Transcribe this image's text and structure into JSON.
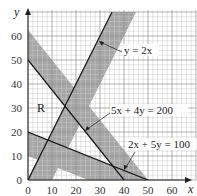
{
  "chart_data": {
    "type": "line",
    "title": "",
    "xlabel": "x",
    "ylabel": "y",
    "xlim": [
      0,
      70
    ],
    "ylim": [
      0,
      70
    ],
    "grid": true,
    "x_ticks": [
      "0",
      "10",
      "20",
      "30",
      "40",
      "50",
      "60"
    ],
    "y_ticks": [
      "0",
      "10",
      "20",
      "30",
      "40",
      "50",
      "60"
    ],
    "series": [
      {
        "name": "y = 2x",
        "points": [
          [
            0,
            0
          ],
          [
            35,
            70
          ]
        ]
      },
      {
        "name": "5x + 4y = 200",
        "points": [
          [
            0,
            50
          ],
          [
            40,
            0
          ]
        ]
      },
      {
        "name": "2x + 5y = 100",
        "points": [
          [
            0,
            20
          ],
          [
            50,
            0
          ]
        ]
      }
    ],
    "shaded_bands": [
      {
        "line": "y = 2x",
        "side": "below/right",
        "polygon": [
          [
            0,
            0
          ],
          [
            10,
            0
          ],
          [
            45,
            70
          ],
          [
            35,
            70
          ]
        ]
      },
      {
        "line": "5x + 4y = 200",
        "side": "above",
        "polygon": [
          [
            0,
            50
          ],
          [
            40,
            0
          ],
          [
            50,
            0
          ],
          [
            0,
            62.5
          ]
        ]
      },
      {
        "line": "2x + 5y = 100",
        "side": "below",
        "polygon": [
          [
            0,
            20
          ],
          [
            50,
            0
          ],
          [
            25,
            0
          ],
          [
            0,
            10
          ]
        ]
      }
    ],
    "annotations": [
      {
        "text": "R",
        "x": 6,
        "y": 30
      },
      {
        "text": "y = 2x",
        "x": 38,
        "y": 52
      },
      {
        "text": "5x + 4y = 200",
        "x": 34,
        "y": 27
      },
      {
        "text": "2x + 5y = 100",
        "x": 43,
        "y": 15
      }
    ]
  },
  "labels": {
    "x_axis": "x",
    "y_axis": "y",
    "region": "R",
    "eq1": "y = 2x",
    "eq2": "5x + 4y = 200",
    "eq3": "2x + 5y = 100",
    "x_ticks": [
      "0",
      "10",
      "20",
      "30",
      "40",
      "50",
      "60"
    ],
    "y_ticks": [
      "0",
      "10",
      "20",
      "30",
      "40",
      "50",
      "60"
    ]
  },
  "colors": {
    "band": "#a6a6a6",
    "grid_minor": "#cfcfcf",
    "grid_major": "#9a9a9a",
    "line": "#222222"
  }
}
